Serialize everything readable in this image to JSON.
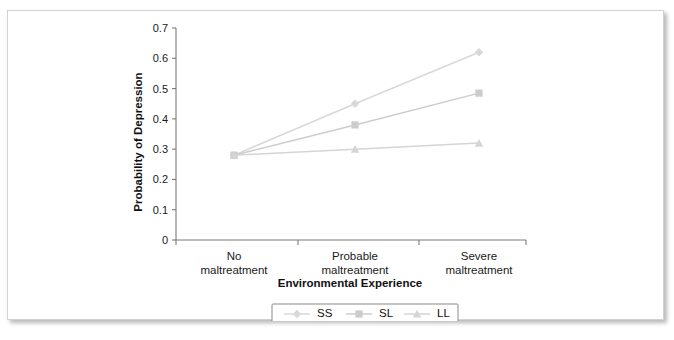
{
  "figure": {
    "frame_border_color": "#d2d2d2",
    "background": "#ffffff"
  },
  "chart_data": {
    "type": "line",
    "title": "",
    "xlabel": "Environmental Experience",
    "ylabel": "Probability of Depression",
    "categories": [
      "No maltreatment",
      "Probable maltreatment",
      "Severe maltreatment"
    ],
    "category_lines": [
      [
        "No",
        "maltreatment"
      ],
      [
        "Probable",
        "maltreatment"
      ],
      [
        "Severe",
        "maltreatment"
      ]
    ],
    "ylim": [
      0,
      0.7
    ],
    "yticks": [
      0,
      0.1,
      0.2,
      0.3,
      0.4,
      0.5,
      0.6,
      0.7
    ],
    "ytick_labels": [
      "0",
      "0.1",
      "0.2",
      "0.3",
      "0.4",
      "0.5",
      "0.6",
      "0.7"
    ],
    "grid": false,
    "legend_position": "bottom",
    "series": [
      {
        "name": "SS",
        "marker": "diamond",
        "color": "#d8d8d8",
        "values": [
          0.28,
          0.45,
          0.62
        ]
      },
      {
        "name": "SL",
        "marker": "square",
        "color": "#cccccc",
        "values": [
          0.28,
          0.38,
          0.485
        ]
      },
      {
        "name": "LL",
        "marker": "triangle",
        "color": "#d5d5d5",
        "values": [
          0.28,
          0.3,
          0.32
        ]
      }
    ]
  }
}
